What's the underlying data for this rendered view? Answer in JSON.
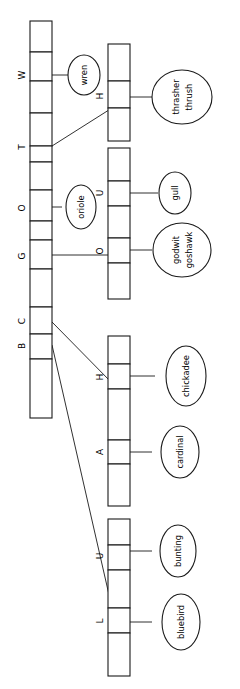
{
  "diagram": {
    "orientation": "rotated-90",
    "stroke_color": "#1a1a1a",
    "background": "#ffffff",
    "main_table": {
      "name": "primary-hash-table",
      "cell_count": 13,
      "index_labels": [
        {
          "label": "W",
          "cell": 1
        },
        {
          "label": "T",
          "cell": 3
        },
        {
          "label": "O",
          "cell": 6
        },
        {
          "label": "G",
          "cell": 8
        },
        {
          "label": "C",
          "cell": 10
        },
        {
          "label": "B",
          "cell": 11
        }
      ]
    },
    "sub_tables": [
      {
        "name": "sub-table-h",
        "cell_count": 3,
        "index_labels": [
          {
            "label": "H",
            "cell": 1
          }
        ]
      },
      {
        "name": "sub-table-uo",
        "cell_count": 5,
        "index_labels": [
          {
            "label": "U",
            "cell": 1
          },
          {
            "label": "O",
            "cell": 3
          }
        ]
      },
      {
        "name": "sub-table-ha",
        "cell_count": 5,
        "index_labels": [
          {
            "label": "H",
            "cell": 1
          },
          {
            "label": "A",
            "cell": 3
          }
        ]
      },
      {
        "name": "sub-table-ul",
        "cell_count": 5,
        "index_labels": [
          {
            "label": "U",
            "cell": 1
          },
          {
            "label": "L",
            "cell": 3
          }
        ]
      }
    ],
    "leaf_nodes": [
      {
        "name": "leaf-wren",
        "lines": [
          "wren"
        ]
      },
      {
        "name": "leaf-thrasher-thrush",
        "lines": [
          "thrasher",
          "thrush"
        ]
      },
      {
        "name": "leaf-oriole",
        "lines": [
          "oriole"
        ]
      },
      {
        "name": "leaf-gull",
        "lines": [
          "gull"
        ]
      },
      {
        "name": "leaf-godwit-goshawk",
        "lines": [
          "godwit",
          "goshawk"
        ]
      },
      {
        "name": "leaf-chickadee",
        "lines": [
          "chickadee"
        ]
      },
      {
        "name": "leaf-cardinal",
        "lines": [
          "cardinal"
        ]
      },
      {
        "name": "leaf-bunting",
        "lines": [
          "bunting"
        ]
      },
      {
        "name": "leaf-bluebird",
        "lines": [
          "bluebird"
        ]
      }
    ]
  }
}
